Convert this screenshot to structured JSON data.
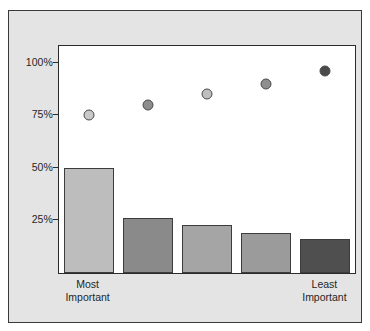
{
  "chart_data": {
    "type": "bar",
    "title": "",
    "subtitle": "",
    "xlabel": "",
    "ylabel": "",
    "grid": false,
    "legend": "none",
    "categories": [
      "Most Important",
      "",
      "",
      "",
      "Least Important"
    ],
    "x_tick_labels": [
      {
        "index": 0,
        "line1": "Most",
        "line2": "Important"
      },
      {
        "index": 4,
        "line1": "Least",
        "line2": "Important"
      }
    ],
    "y_axis": {
      "ticks": [
        "25%",
        "50%",
        "75%",
        "100%"
      ],
      "tick_values": [
        25,
        50,
        75,
        100
      ],
      "ylim": [
        0,
        108
      ],
      "unit": "%"
    },
    "series": [
      {
        "name": "bars",
        "type": "bar",
        "values": [
          50,
          26,
          23,
          19,
          16
        ],
        "colors": [
          "#bdbdbd",
          "#8a8a8a",
          "#a5a5a5",
          "#9b9b9b",
          "#4f4f4f"
        ]
      },
      {
        "name": "dots",
        "type": "scatter",
        "values": [
          75,
          80,
          85,
          90,
          96
        ],
        "colors": [
          "#c9c9c9",
          "#8d8d8d",
          "#bfbfbf",
          "#8f8f8f",
          "#4a4a4a"
        ]
      }
    ]
  },
  "figure": {
    "background_color": "#e4e4e4",
    "plot_background_color": "#ffffff",
    "border_color": "#3a3a3a"
  }
}
